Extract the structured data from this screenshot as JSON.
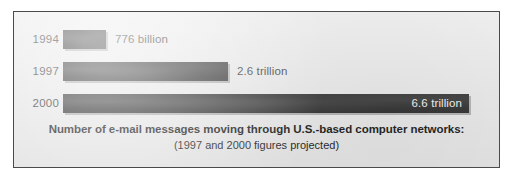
{
  "chart_data": {
    "type": "bar",
    "orientation": "horizontal",
    "title": "Number of e-mail messages moving through U.S.-based computer networks:",
    "subtitle": "(1997 and 2000 figures projected)",
    "xlabel": "",
    "ylabel": "",
    "grid": false,
    "legend": "none",
    "categories": [
      "1994",
      "1997",
      "2000"
    ],
    "values": [
      776000000000,
      2600000000000,
      6600000000000
    ],
    "value_labels": [
      "776 billion",
      "2.6 trillion",
      "6.6 trillion"
    ],
    "xlim": [
      0,
      6600000000000
    ],
    "bar_color": "#1c1c1c",
    "background_color": "#e8e8e8",
    "border_color": "#4a4a4a",
    "label_inside_color": "#f2f2f2",
    "bars": [
      {
        "category": "1994",
        "value_label": "776 billion",
        "bar_width_px": 43,
        "label_position": "outside"
      },
      {
        "category": "1997",
        "value_label": "2.6 trillion",
        "bar_width_px": 165,
        "label_position": "outside"
      },
      {
        "category": "2000",
        "value_label": "6.6 trillion",
        "bar_width_px": 406,
        "label_position": "inside"
      }
    ]
  },
  "caption": {
    "main": "Number of e-mail messages moving through U.S.-based computer networks:",
    "sub": "(1997 and 2000 figures projected)"
  }
}
